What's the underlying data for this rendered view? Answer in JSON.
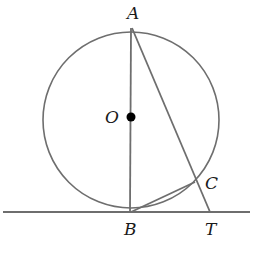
{
  "diagram": {
    "type": "geometry",
    "colors": {
      "stroke": "#6e6e6e",
      "label": "#1a1a1a",
      "center_dot": "#000000"
    },
    "circle": {
      "center": "O",
      "cx": 131,
      "cy": 120,
      "r": 88
    },
    "points": {
      "A": {
        "label": "A",
        "x": 132,
        "y": 28
      },
      "O": {
        "label": "O",
        "x": 131,
        "y": 117
      },
      "B": {
        "label": "B",
        "x": 130,
        "y": 212
      },
      "C": {
        "label": "C",
        "x": 195,
        "y": 182
      },
      "T": {
        "label": "T",
        "x": 210,
        "y": 212
      }
    },
    "segments": [
      {
        "from": "A",
        "to": "B",
        "name": "diameter AB"
      },
      {
        "from": "A",
        "to": "T",
        "name": "secant AT"
      },
      {
        "from": "B",
        "to": "C",
        "name": "chord BC"
      }
    ],
    "tangent_line": {
      "at": "B",
      "x1": 3,
      "x2": 250,
      "y": 212
    }
  }
}
